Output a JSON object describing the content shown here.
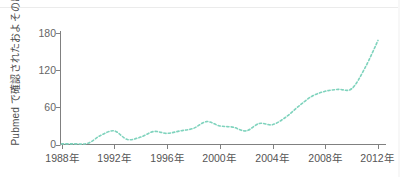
{
  "chart_data": {
    "type": "line",
    "title": "",
    "xlabel": "",
    "ylabel": "Pubmed で確認されたおよその出版数",
    "xlim": [
      1988,
      2012
    ],
    "ylim": [
      0,
      180
    ],
    "xticks": [
      "1988年",
      "1992年",
      "1996年",
      "2000年",
      "2004年",
      "2008年",
      "2012年"
    ],
    "xtick_values": [
      1988,
      1992,
      1996,
      2000,
      2004,
      2008,
      2012
    ],
    "yticks": [
      "0",
      "60",
      "120",
      "180"
    ],
    "ytick_values": [
      0,
      60,
      120,
      180
    ],
    "grid": false,
    "legend": null,
    "series": [
      {
        "name": "Pubmed publications",
        "line_style": "dashed",
        "color": "#7fd3bd",
        "x": [
          1988,
          1989,
          1990,
          1991,
          1992,
          1993,
          1994,
          1995,
          1996,
          1997,
          1998,
          1999,
          2000,
          2001,
          2002,
          2003,
          2004,
          2005,
          2006,
          2007,
          2008,
          2009,
          2010,
          2011,
          2012
        ],
        "values": [
          1,
          1,
          2,
          15,
          22,
          8,
          12,
          21,
          18,
          22,
          26,
          37,
          30,
          28,
          22,
          34,
          32,
          44,
          62,
          78,
          86,
          89,
          90,
          123,
          168
        ]
      }
    ]
  },
  "axis": {
    "y_axis_color": "#808080",
    "x_axis_color": "#808080"
  }
}
